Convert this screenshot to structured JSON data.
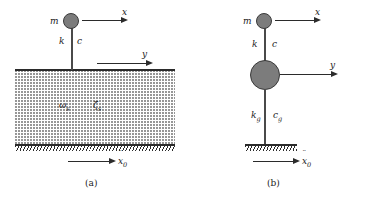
{
  "figure": {
    "colors": {
      "mass_fill": "#7c7c7c",
      "mass_stroke": "#3a3a3a",
      "line": "#2b2b2b",
      "soil_dots": "#8f8f8f",
      "background": "#ffffff"
    }
  },
  "panel_a": {
    "caption": "(a)",
    "mass_label": "m",
    "spring_label": "k",
    "dashpot_label": "c",
    "x_arrow_label": "x",
    "y_arrow_label": "y",
    "soil_frequency_label": "ω",
    "soil_frequency_sub": "s",
    "soil_damping_label": "ζ",
    "soil_damping_sub": "s",
    "base_accel_label": "x",
    "base_accel_sub": "0"
  },
  "panel_b": {
    "caption": "(b)",
    "mass_label": "m",
    "spring_label": "k",
    "dashpot_label": "c",
    "x_arrow_label": "x",
    "y_arrow_label": "y",
    "ground_spring_label": "k",
    "ground_spring_sub": "g",
    "ground_dashpot_label": "c",
    "ground_dashpot_sub": "g",
    "base_accel_label": "x",
    "base_accel_sub": "0"
  }
}
